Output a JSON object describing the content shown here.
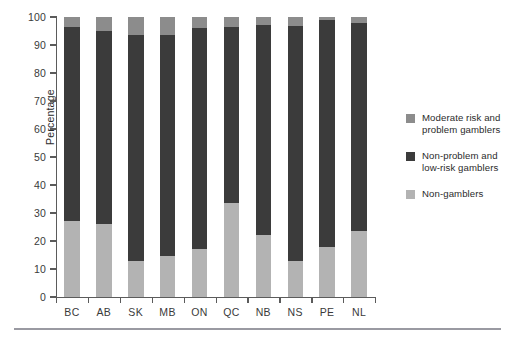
{
  "chart_data": {
    "type": "bar",
    "stacked": true,
    "title": "",
    "xlabel": "",
    "ylabel": "Percentage",
    "ylim": [
      0,
      100
    ],
    "yticks": [
      0,
      10,
      20,
      30,
      40,
      50,
      60,
      70,
      80,
      90,
      100
    ],
    "ytick_labels": [
      "0",
      "10",
      "20",
      "30",
      "40",
      "50",
      "60",
      "70",
      "80",
      "90",
      "100"
    ],
    "grid": false,
    "legend_position": "right",
    "categories": [
      "BC",
      "AB",
      "SK",
      "MB",
      "ON",
      "QC",
      "NB",
      "NS",
      "PE",
      "NL"
    ],
    "series": [
      {
        "name": "Non-gamblers",
        "color": "#b3b3b3",
        "values": [
          27.0,
          26.0,
          13.0,
          14.5,
          17.0,
          33.5,
          22.0,
          13.0,
          18.0,
          23.5
        ]
      },
      {
        "name": "Non-problem and low-risk gamblers",
        "color": "#3b3b3b",
        "values": [
          69.4,
          68.9,
          80.6,
          79.0,
          79.1,
          63.0,
          75.0,
          83.7,
          81.0,
          74.2
        ]
      },
      {
        "name": "Moderate risk and problem gamblers",
        "color": "#8c8c8c",
        "values": [
          3.6,
          5.1,
          6.4,
          6.5,
          3.9,
          3.5,
          3.0,
          3.3,
          1.0,
          2.3
        ]
      }
    ]
  },
  "axis": {
    "y_title": "Percentage",
    "y_ticks": [
      "100",
      "90",
      "80",
      "70",
      "60",
      "50",
      "40",
      "30",
      "20",
      "10",
      "0"
    ],
    "x_ticks": [
      "BC",
      "AB",
      "SK",
      "MB",
      "ON",
      "QC",
      "NB",
      "NS",
      "PE",
      "NL"
    ]
  },
  "legend": {
    "items": [
      {
        "label": "Moderate risk and problem gamblers",
        "color": "#8c8c8c"
      },
      {
        "label": "Non-problem and low-risk gamblers",
        "color": "#3b3b3b"
      },
      {
        "label": "Non-gamblers",
        "color": "#b3b3b3"
      }
    ]
  },
  "colors": {
    "moderate_risk": "#8c8c8c",
    "non_problem": "#3b3b3b",
    "non_gamblers": "#b3b3b3",
    "axis": "#5b5b5b",
    "footer_rule": "#9a9aa2",
    "background": "#ffffff"
  }
}
